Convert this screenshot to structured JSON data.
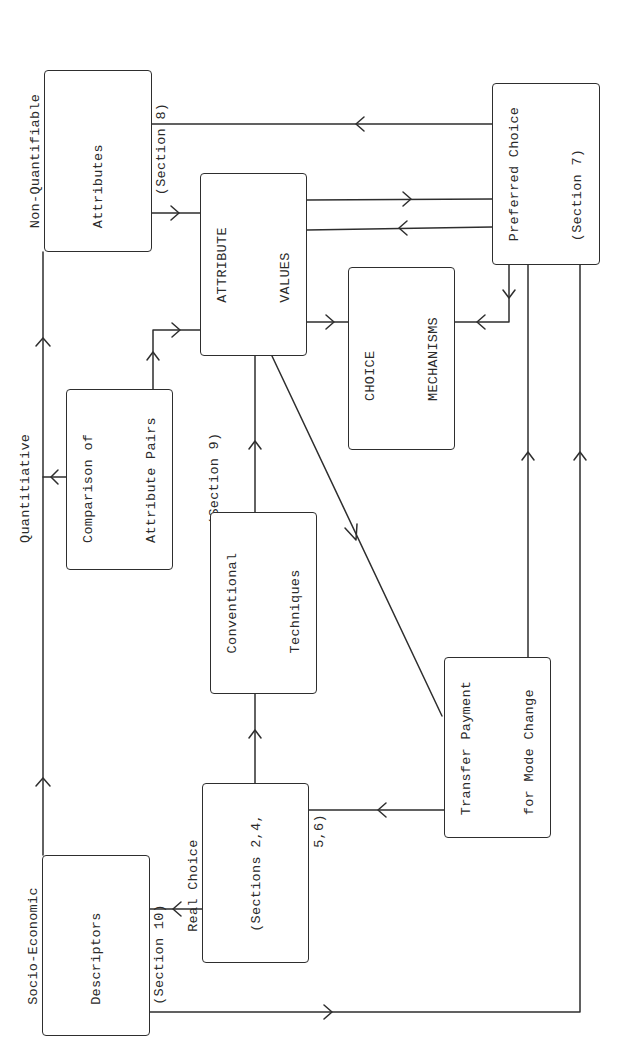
{
  "diagram": {
    "orientation": "rotated 90 degrees counter-clockwise",
    "stroke_color": "#2e2e2e",
    "nodes": [
      {
        "id": "non_quantifiable",
        "lines": [
          "Non-Quantifiable",
          "Attributes",
          "(Section 8)"
        ]
      },
      {
        "id": "preferred_choice",
        "lines": [
          "Preferred Choice",
          "(Section 7)"
        ]
      },
      {
        "id": "attribute_values",
        "lines": [
          "ATTRIBUTE",
          "VALUES"
        ]
      },
      {
        "id": "choice_mechanisms",
        "lines": [
          "CHOICE",
          "MECHANISMS"
        ]
      },
      {
        "id": "quantitative_comparison",
        "lines": [
          "Quantitiative",
          "Comparison of",
          "Attribute Pairs",
          "(Section 9)"
        ]
      },
      {
        "id": "conventional_techniques",
        "lines": [
          "Conventional",
          "Techniques"
        ]
      },
      {
        "id": "transfer_payment",
        "lines": [
          "Transfer Payment",
          "for Mode Change"
        ]
      },
      {
        "id": "real_choice",
        "lines": [
          "Real Choice",
          "(Sections 2,4,",
          "          5,6)"
        ]
      },
      {
        "id": "socio_economic",
        "lines": [
          "Socio-Economic",
          "Descriptors",
          "(Section 10)"
        ]
      }
    ],
    "edges": [
      {
        "from": "non_quantifiable",
        "to": "attribute_values"
      },
      {
        "from": "preferred_choice",
        "to": "non_quantifiable"
      },
      {
        "from": "attribute_values",
        "to": "preferred_choice"
      },
      {
        "from": "preferred_choice",
        "to": "attribute_values"
      },
      {
        "from": "attribute_values",
        "to": "choice_mechanisms"
      },
      {
        "from": "preferred_choice",
        "to": "choice_mechanisms"
      },
      {
        "from": "quantitative_comparison",
        "to": "attribute_values"
      },
      {
        "from": "quantitative_comparison",
        "to": "left_bus"
      },
      {
        "from": "conventional_techniques",
        "to": "attribute_values"
      },
      {
        "from": "attribute_values",
        "to": "transfer_payment"
      },
      {
        "from": "real_choice",
        "to": "conventional_techniques"
      },
      {
        "from": "transfer_payment",
        "to": "real_choice"
      },
      {
        "from": "transfer_payment",
        "to": "preferred_choice"
      },
      {
        "from": "real_choice",
        "to": "socio_economic"
      },
      {
        "from": "socio_economic",
        "to": "non_quantifiable"
      },
      {
        "from": "socio_economic",
        "to": "preferred_choice"
      }
    ]
  }
}
